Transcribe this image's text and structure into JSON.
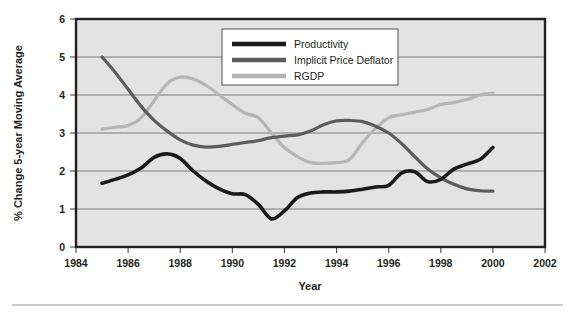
{
  "chart_data": {
    "type": "line",
    "title": "",
    "xlabel": "Year",
    "ylabel": "% Change 5-year Moving Average",
    "xlim": [
      1984,
      2002
    ],
    "ylim": [
      0,
      6
    ],
    "xticks": [
      1984,
      1986,
      1988,
      1990,
      1992,
      1994,
      1996,
      1998,
      2000,
      2002
    ],
    "yticks": [
      0,
      1,
      2,
      3,
      4,
      5,
      6
    ],
    "grid": "horizontal",
    "legend_position": "top-center",
    "plot_background": "#e3e3e3",
    "series": [
      {
        "name": "Productivity",
        "color": "#1a1a1a",
        "x": [
          1985,
          1985.5,
          1986,
          1986.5,
          1987,
          1987.5,
          1988,
          1988.5,
          1989,
          1989.5,
          1990,
          1990.5,
          1991,
          1991.5,
          1992,
          1992.5,
          1993,
          1993.5,
          1994,
          1994.5,
          1995,
          1995.5,
          1996,
          1996.5,
          1997,
          1997.5,
          1998,
          1998.5,
          1999,
          1999.5,
          2000
        ],
        "values": [
          1.68,
          1.78,
          1.9,
          2.08,
          2.36,
          2.45,
          2.33,
          2.0,
          1.73,
          1.53,
          1.4,
          1.38,
          1.12,
          0.74,
          0.95,
          1.3,
          1.42,
          1.45,
          1.45,
          1.47,
          1.52,
          1.58,
          1.62,
          1.95,
          1.98,
          1.72,
          1.78,
          2.05,
          2.18,
          2.3,
          2.62
        ]
      },
      {
        "name": "Implicit Price Deflator",
        "color": "#5c5c5c",
        "x": [
          1985,
          1985.5,
          1986,
          1986.5,
          1987,
          1987.5,
          1988,
          1988.5,
          1989,
          1989.5,
          1990,
          1990.5,
          1991,
          1991.5,
          1992,
          1992.5,
          1993,
          1993.5,
          1994,
          1994.5,
          1995,
          1995.5,
          1996,
          1996.5,
          1997,
          1997.5,
          1998,
          1998.5,
          1999,
          1999.5,
          2000
        ],
        "values": [
          5.0,
          4.6,
          4.15,
          3.7,
          3.33,
          3.05,
          2.82,
          2.68,
          2.63,
          2.65,
          2.7,
          2.75,
          2.8,
          2.88,
          2.92,
          2.95,
          3.05,
          3.22,
          3.32,
          3.33,
          3.3,
          3.18,
          3.0,
          2.72,
          2.38,
          2.05,
          1.82,
          1.65,
          1.53,
          1.48,
          1.47
        ]
      },
      {
        "name": "RGDP",
        "color": "#b5b5b5",
        "x": [
          1985,
          1985.5,
          1986,
          1986.5,
          1987,
          1987.5,
          1988,
          1988.5,
          1989,
          1989.5,
          1990,
          1990.5,
          1991,
          1991.5,
          1992,
          1992.5,
          1993,
          1993.5,
          1994,
          1994.5,
          1995,
          1995.5,
          1996,
          1996.5,
          1997,
          1997.5,
          1998,
          1998.5,
          1999,
          1999.5,
          2000
        ],
        "values": [
          3.1,
          3.15,
          3.2,
          3.4,
          3.85,
          4.3,
          4.47,
          4.42,
          4.25,
          4.0,
          3.75,
          3.52,
          3.4,
          3.0,
          2.62,
          2.38,
          2.22,
          2.2,
          2.22,
          2.3,
          2.75,
          3.12,
          3.4,
          3.48,
          3.55,
          3.62,
          3.75,
          3.8,
          3.88,
          4.0,
          4.05
        ]
      }
    ]
  },
  "legend": {
    "entries": [
      {
        "label": "Productivity",
        "swatch_color": "#1a1a1a"
      },
      {
        "label": "Implicit Price Deflator",
        "swatch_color": "#5c5c5c"
      },
      {
        "label": "RGDP",
        "swatch_color": "#b5b5b5"
      }
    ]
  },
  "axes": {
    "y_title": "% Change 5-year Moving Average",
    "x_title": "Year",
    "y_tick_labels": [
      "6",
      "5",
      "4",
      "3",
      "2",
      "1",
      "0"
    ],
    "x_tick_labels": [
      "1984",
      "1986",
      "1988",
      "1990",
      "1992",
      "1994",
      "1996",
      "1998",
      "2000",
      "2002"
    ]
  }
}
